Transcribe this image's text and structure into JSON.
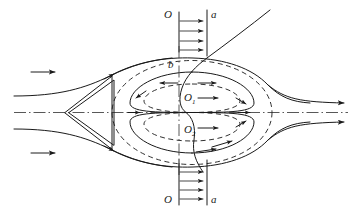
{
  "figure": {
    "width": 358,
    "height": 219,
    "background_color": "#ffffff",
    "line_color": "#1a1a1a"
  },
  "labels": {
    "section_top_left": "O",
    "section_top_right": "a",
    "section_bottom_left": "O",
    "section_bottom_right": "a",
    "separation_point": "b",
    "vortex_upper_base": "O",
    "vortex_upper_sub": "1",
    "vortex_lower_base": "O",
    "vortex_lower_sub": "2"
  },
  "elements": {
    "body_name": "triangular-wedge",
    "axis_name": "horizontal-centerline",
    "section_line_name": "section-line-O-O",
    "profile_line_name": "velocity-profile-line-a-a",
    "inflow_arrow_count": 2,
    "outflow_arrow_count": 2,
    "top_profile_arrow_count": 4,
    "bottom_profile_arrow_count": 4
  }
}
